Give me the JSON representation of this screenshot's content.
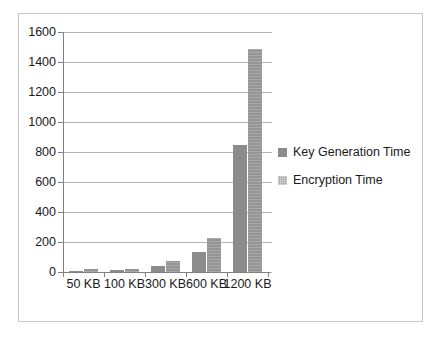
{
  "chart_data": {
    "type": "bar",
    "title": "",
    "subtitle": "",
    "xlabel": "",
    "ylabel": "",
    "categories": [
      "50 KB",
      "100 KB",
      "300 KB",
      "600 KB",
      "1200 KB"
    ],
    "series": [
      {
        "name": "Key Generation Time",
        "values": [
          10,
          12,
          40,
          133,
          845
        ],
        "color": "#8c8c8c"
      },
      {
        "name": "Encryption Time",
        "values": [
          18,
          22,
          75,
          227,
          1490
        ],
        "color": "#959595"
      }
    ],
    "ylim": [
      0,
      1600
    ],
    "ytick_step": 200,
    "yticks": [
      0,
      200,
      400,
      600,
      800,
      1000,
      1200,
      1400,
      1600
    ],
    "ytick_labels": [
      "0",
      "200",
      "400",
      "600",
      "800",
      "1000",
      "1200",
      "1400",
      "1600"
    ],
    "grid": true,
    "grid_axis": "y",
    "legend": true,
    "legend_position": "right",
    "legend_entries": [
      "Key Generation Time",
      "Encryption Time"
    ],
    "annotations": []
  },
  "frame": {
    "border_color": "#c9c9c9",
    "background": "#ffffff"
  },
  "axes": {
    "axis_line_color": "#808080",
    "gridline_color": "#b3b3b3",
    "tick_label_color": "#1a1a1a"
  }
}
